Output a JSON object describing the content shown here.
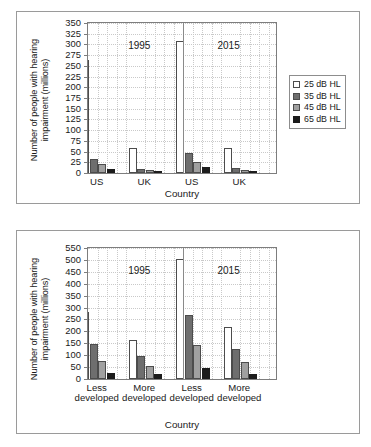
{
  "chart_data": [
    {
      "id": "top",
      "type": "bar",
      "title": "",
      "xlabel": "Country",
      "ylabel": "Number of people with hearing impairment (millions)",
      "ylabel_lines": [
        "Number of people with hearing",
        "impairment (millions)"
      ],
      "ylim": [
        0,
        350
      ],
      "ytick_step": 25,
      "yticks": [
        0,
        25,
        50,
        75,
        100,
        125,
        150,
        175,
        200,
        225,
        250,
        275,
        300,
        325,
        350
      ],
      "grid": true,
      "legend_position": "right",
      "categories": [
        "US",
        "UK",
        "US",
        "UK"
      ],
      "group_annotations": [
        {
          "label": "1995",
          "spans": [
            0,
            1
          ]
        },
        {
          "label": "2015",
          "spans": [
            2,
            3
          ]
        }
      ],
      "series": [
        {
          "name": "25 dB HL",
          "color": "#ffffff",
          "values": [
            263,
            58,
            307,
            59
          ]
        },
        {
          "name": "35 dB HL",
          "color": "#6e6e6e",
          "values": [
            33,
            10,
            46,
            11
          ]
        },
        {
          "name": "45 dB HL",
          "color": "#a0a0a0",
          "values": [
            20,
            6,
            26,
            7
          ]
        },
        {
          "name": "65 dB HL",
          "color": "#1c1c1c",
          "values": [
            10,
            3,
            15,
            4
          ]
        }
      ],
      "legend": [
        {
          "label": "25 dB HL",
          "color": "#ffffff"
        },
        {
          "label": "35 dB HL",
          "color": "#6e6e6e"
        },
        {
          "label": "45 dB HL",
          "color": "#a0a0a0"
        },
        {
          "label": "65 dB HL",
          "color": "#1c1c1c"
        }
      ]
    },
    {
      "id": "bottom",
      "type": "bar",
      "title": "",
      "xlabel": "Country",
      "ylabel": "Number of people with hearing impairment (millions)",
      "ylabel_lines": [
        "Number of people with hearing",
        "impairment (millions)"
      ],
      "ylim": [
        0,
        550
      ],
      "ytick_step": 50,
      "yticks": [
        0,
        50,
        100,
        150,
        200,
        250,
        300,
        350,
        400,
        450,
        500,
        550
      ],
      "grid": true,
      "legend_position": "right",
      "categories": [
        "Less developed",
        "More developed",
        "Less developed",
        "More developed"
      ],
      "category_lines": [
        [
          "Less",
          "developed"
        ],
        [
          "More",
          "developed"
        ],
        [
          "Less",
          "developed"
        ],
        [
          "More",
          "developed"
        ]
      ],
      "group_annotations": [
        {
          "label": "1995",
          "spans": [
            0,
            1
          ]
        },
        {
          "label": "2015",
          "spans": [
            2,
            3
          ]
        }
      ],
      "series": [
        {
          "name": "25 dB HL",
          "color": "#ffffff",
          "values": [
            282,
            162,
            505,
            217
          ]
        },
        {
          "name": "35 dB Hl",
          "color": "#6e6e6e",
          "values": [
            147,
            95,
            270,
            128
          ]
        },
        {
          "name": "45 dB HL",
          "color": "#a0a0a0",
          "values": [
            75,
            55,
            142,
            73
          ]
        },
        {
          "name": "65 dB HL",
          "color": "#1c1c1c",
          "values": [
            24,
            19,
            46,
            22
          ]
        }
      ],
      "legend": [
        {
          "label": "25 dB HL",
          "color": "#ffffff"
        },
        {
          "label": "35 dB Hl",
          "color": "#6e6e6e"
        },
        {
          "label": "45 dB HL",
          "color": "#a0a0a0"
        },
        {
          "label": "65 dB HL",
          "color": "#1c1c1c"
        }
      ]
    }
  ]
}
